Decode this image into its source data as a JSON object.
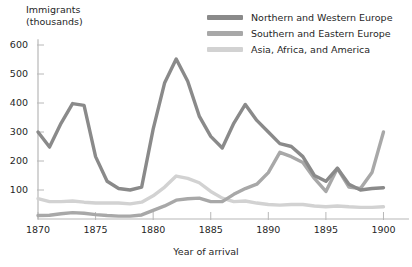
{
  "chart_data": {
    "type": "line",
    "title": "",
    "xlabel": "Year of arrival",
    "ylabel": "Immigrants (thousands)",
    "ylabel_line1": "Immigrants",
    "ylabel_line2": "(thousands)",
    "grid": false,
    "legend_position": "top-right",
    "xlim": [
      1870,
      1901
    ],
    "ylim": [
      0,
      620
    ],
    "xticks": [
      1870,
      1875,
      1880,
      1885,
      1890,
      1895,
      1900
    ],
    "xtick_labels": [
      "1870",
      "1875",
      "1880",
      "1885",
      "1890",
      "1895",
      "1900"
    ],
    "yticks": [
      100,
      200,
      300,
      400,
      500,
      600
    ],
    "ytick_labels": [
      "100",
      "200",
      "300",
      "400",
      "500",
      "600"
    ],
    "x": [
      1870,
      1871,
      1872,
      1873,
      1874,
      1875,
      1876,
      1877,
      1878,
      1879,
      1880,
      1881,
      1882,
      1883,
      1884,
      1885,
      1886,
      1887,
      1888,
      1889,
      1890,
      1891,
      1892,
      1893,
      1894,
      1895,
      1896,
      1897,
      1898,
      1899,
      1900
    ],
    "series": [
      {
        "name": "Northern and Western Europe",
        "color": "#8a8a8a",
        "values": [
          300,
          248,
          330,
          398,
          392,
          215,
          130,
          105,
          100,
          110,
          310,
          470,
          552,
          475,
          355,
          285,
          245,
          330,
          395,
          340,
          300,
          260,
          250,
          215,
          150,
          130,
          175,
          120,
          100,
          105,
          108
        ]
      },
      {
        "name": "Southern and Eastern Europe",
        "color": "#a8a8a8",
        "values": [
          12,
          13,
          18,
          22,
          20,
          15,
          12,
          10,
          10,
          14,
          30,
          45,
          65,
          70,
          72,
          60,
          60,
          85,
          105,
          120,
          160,
          230,
          215,
          195,
          140,
          95,
          175,
          110,
          105,
          160,
          300
        ]
      },
      {
        "name": "Asia, Africa, and America",
        "color": "#d2d2d2",
        "values": [
          70,
          60,
          60,
          62,
          58,
          55,
          55,
          55,
          52,
          58,
          80,
          110,
          148,
          140,
          125,
          95,
          72,
          60,
          62,
          55,
          50,
          48,
          50,
          50,
          45,
          42,
          45,
          42,
          40,
          40,
          42
        ]
      }
    ]
  },
  "legend": {
    "items": [
      {
        "label": "Northern and Western Europe",
        "color": "#8a8a8a"
      },
      {
        "label": "Southern and Eastern Europe",
        "color": "#a8a8a8"
      },
      {
        "label": "Asia, Africa, and America",
        "color": "#d2d2d2"
      }
    ]
  },
  "axis_colors": {
    "axis_line": "#b8b8b8",
    "tick": "#b8b8b8",
    "text": "#1f1f1f"
  }
}
